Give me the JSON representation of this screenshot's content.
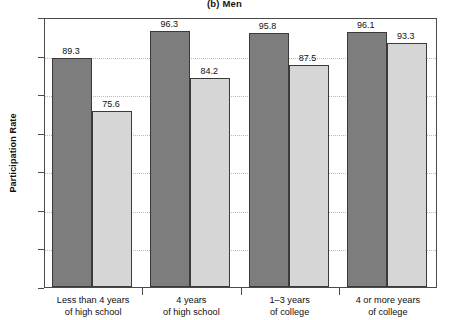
{
  "chart_data": {
    "type": "bar",
    "title": "(b) Men",
    "xlabel": "",
    "ylabel": "Participation Rate",
    "ylim": [
      30.0,
      100.0
    ],
    "yticks": [
      "30.0",
      "40.0",
      "50.0",
      "60.0",
      "70.0",
      "80.0",
      "90.0",
      "100.0"
    ],
    "ytick_values": [
      30.0,
      40.0,
      50.0,
      60.0,
      70.0,
      80.0,
      90.0,
      100.0
    ],
    "grid": "horizontal-dotted",
    "legend": "none",
    "categories": [
      {
        "line1": "Less than 4 years",
        "line2": "of high school"
      },
      {
        "line1": "4 years",
        "line2": "of high school"
      },
      {
        "line1": "1–3 years",
        "line2": "of college"
      },
      {
        "line1": "4 or more years",
        "line2": "of college"
      }
    ],
    "series": [
      {
        "name": "dark",
        "color": "#7d7d7d",
        "values": [
          89.3,
          96.3,
          95.8,
          96.1
        ]
      },
      {
        "name": "light",
        "color": "#d6d6d6",
        "values": [
          75.6,
          84.2,
          87.5,
          93.3
        ]
      }
    ],
    "value_labels": [
      "89.3",
      "75.6",
      "96.3",
      "84.2",
      "95.8",
      "87.5",
      "96.1",
      "93.3"
    ]
  }
}
